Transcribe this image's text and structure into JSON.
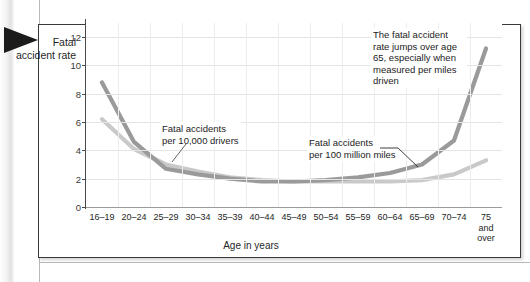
{
  "figure": {
    "y_axis_title": "Fatal accident rate",
    "x_axis_title": "Age in years"
  },
  "annotations": {
    "drivers": "Fatal accidents\nper 10,000 drivers",
    "miles": "Fatal accidents\nper 100 million miles",
    "jump": "The fatal accident rate jumps over age 65, especially when measured per miles driven"
  },
  "colors": {
    "series_miles": "#9a9a9a",
    "series_drivers": "#c9c9c9",
    "grid": "#e4e4e4",
    "axis": "#4a4a4a",
    "box_border": "#3a3a3a",
    "text": "#1c1c1c",
    "arrow_marker": "#1c1c1c"
  },
  "chart_data": {
    "type": "line",
    "title": "",
    "xlabel": "Age in years",
    "ylabel": "Fatal accident rate",
    "ylim": [
      0,
      13
    ],
    "yticks": [
      0,
      2,
      4,
      6,
      8,
      10,
      12
    ],
    "grid": true,
    "legend": "annotations-inline",
    "categories": [
      "16–19",
      "20–24",
      "25–29",
      "30–34",
      "35–39",
      "40–44",
      "45–49",
      "50–54",
      "55–59",
      "60–64",
      "65–69",
      "70–74",
      "75\nand\nover"
    ],
    "series": [
      {
        "name": "Fatal accidents per 100 million miles",
        "color": "#9a9a9a",
        "values": [
          8.8,
          4.6,
          2.7,
          2.3,
          2.0,
          1.8,
          1.8,
          1.9,
          2.1,
          2.4,
          3.0,
          4.7,
          11.2
        ]
      },
      {
        "name": "Fatal accidents per 10,000 drivers",
        "color": "#c9c9c9",
        "values": [
          6.2,
          4.1,
          3.0,
          2.5,
          2.1,
          1.9,
          1.8,
          1.8,
          1.8,
          1.8,
          1.9,
          2.3,
          3.3
        ]
      }
    ]
  }
}
